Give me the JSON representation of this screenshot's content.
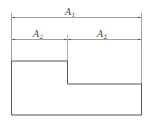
{
  "diagram": {
    "type": "stepped cross-section with dimension lines",
    "colors": {
      "line": "#555555",
      "dim": "#777777",
      "text": "#444444",
      "background": "#ffffff"
    },
    "dimensions": [
      {
        "id": "A1",
        "base": "A",
        "subscript": "1",
        "span": "full width"
      },
      {
        "id": "A2",
        "base": "A",
        "subscript": "2",
        "span": "left section"
      },
      {
        "id": "Asigma",
        "base": "A",
        "subscript": "Σ",
        "span": "right section"
      }
    ]
  }
}
